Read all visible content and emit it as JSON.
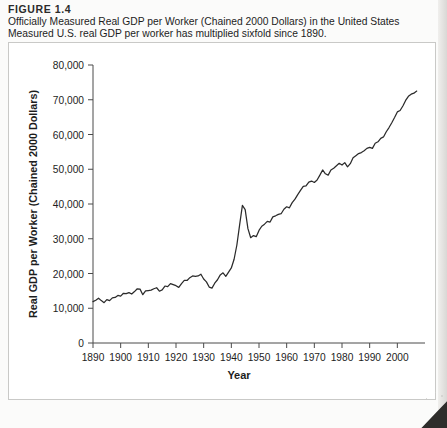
{
  "figure": {
    "number": "FIGURE 1.4",
    "description": "Officially Measured Real GDP per Worker (Chained 2000 Dollars) in the United States Measured U.S. real GDP per worker has multiplied sixfold since 1890."
  },
  "chart_data": {
    "type": "line",
    "title": "Officially Measured Real GDP per Worker (Chained 2000 Dollars) in the United States",
    "xlabel": "Year",
    "ylabel": "Real GDP per Worker (Chained 2000 Dollars)",
    "xlim": [
      1890,
      2010
    ],
    "ylim": [
      0,
      80000
    ],
    "xticks": [
      1890,
      1900,
      1910,
      1920,
      1930,
      1940,
      1950,
      1960,
      1970,
      1980,
      1990,
      2000
    ],
    "xtick_labels": [
      "1890",
      "1900",
      "1910",
      "1920",
      "1930",
      "1940",
      "1950",
      "1960",
      "1970",
      "1980",
      "1990",
      "2000"
    ],
    "yticks": [
      0,
      10000,
      20000,
      30000,
      40000,
      50000,
      60000,
      70000,
      80000
    ],
    "ytick_labels": [
      "0",
      "10,000",
      "20,000",
      "30,000",
      "40,000",
      "50,000",
      "60,000",
      "70,000",
      "80,000"
    ],
    "grid": false,
    "legend": "none",
    "line_color": "#2b2b2b",
    "series": [
      {
        "name": "Real GDP per Worker",
        "x": [
          1890,
          1891,
          1892,
          1893,
          1894,
          1895,
          1896,
          1897,
          1898,
          1899,
          1900,
          1901,
          1902,
          1903,
          1904,
          1905,
          1906,
          1907,
          1908,
          1909,
          1910,
          1911,
          1912,
          1913,
          1914,
          1915,
          1916,
          1917,
          1918,
          1919,
          1920,
          1921,
          1922,
          1923,
          1924,
          1925,
          1926,
          1927,
          1928,
          1929,
          1930,
          1931,
          1932,
          1933,
          1934,
          1935,
          1936,
          1937,
          1938,
          1939,
          1940,
          1941,
          1942,
          1943,
          1944,
          1945,
          1946,
          1947,
          1948,
          1949,
          1950,
          1951,
          1952,
          1953,
          1954,
          1955,
          1956,
          1957,
          1958,
          1959,
          1960,
          1961,
          1962,
          1963,
          1964,
          1965,
          1966,
          1967,
          1968,
          1969,
          1970,
          1971,
          1972,
          1973,
          1974,
          1975,
          1976,
          1977,
          1978,
          1979,
          1980,
          1981,
          1982,
          1983,
          1984,
          1985,
          1986,
          1987,
          1988,
          1989,
          1990,
          1991,
          1992,
          1993,
          1994,
          1995,
          1996,
          1997,
          1998,
          1999,
          2000,
          2001,
          2002,
          2003,
          2004,
          2005,
          2006,
          2007
        ],
        "values": [
          11900,
          12300,
          12900,
          12200,
          11600,
          12500,
          12200,
          13000,
          13100,
          13700,
          13500,
          14300,
          14200,
          14500,
          14100,
          14800,
          15600,
          15500,
          13900,
          15000,
          15100,
          15200,
          15600,
          15900,
          14900,
          15300,
          16400,
          16200,
          17100,
          16800,
          16500,
          16000,
          17100,
          18000,
          18000,
          18800,
          19300,
          19200,
          19300,
          19800,
          18400,
          17600,
          16100,
          15800,
          17200,
          18200,
          19600,
          20200,
          19200,
          20400,
          21600,
          24100,
          28200,
          34000,
          39600,
          38400,
          32900,
          30300,
          30900,
          30600,
          32400,
          33600,
          34200,
          35000,
          34800,
          36300,
          36600,
          37000,
          37200,
          38500,
          39200,
          38900,
          40400,
          41400,
          42700,
          43900,
          45100,
          45200,
          46300,
          46600,
          46200,
          46900,
          48300,
          49800,
          48700,
          48300,
          49800,
          50300,
          51000,
          51700,
          51200,
          51900,
          50700,
          51600,
          53300,
          53900,
          54500,
          54800,
          55300,
          56000,
          56300,
          56000,
          57500,
          57900,
          58900,
          59300,
          60800,
          62000,
          63400,
          64900,
          66500,
          66900,
          68200,
          69800,
          71000,
          71600,
          71900,
          72500
        ]
      }
    ]
  }
}
